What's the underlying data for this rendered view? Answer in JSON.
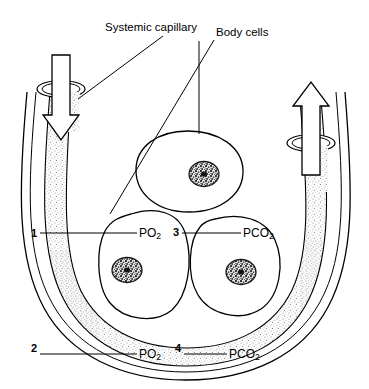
{
  "figure": {
    "title_labels": [
      {
        "id": "systemic-capillary",
        "text": "Systemic capillary",
        "x": 105,
        "y": 22
      },
      {
        "id": "body-cells",
        "text": "Body cells",
        "x": 216,
        "y": 27
      }
    ],
    "gas_labels": [
      {
        "id": "po2-upper",
        "text": "PO",
        "sub": "2",
        "x": 139,
        "y": 227
      },
      {
        "id": "pco2-upper",
        "text": "PCO",
        "sub": "2",
        "x": 243,
        "y": 227
      },
      {
        "id": "po2-lower",
        "text": "PO",
        "sub": "2",
        "x": 139,
        "y": 348
      },
      {
        "id": "pco2-lower",
        "text": "PCO",
        "sub": "2",
        "x": 229,
        "y": 348
      }
    ],
    "number_markers": [
      {
        "id": "marker-1",
        "text": "1",
        "x": 31,
        "y": 228
      },
      {
        "id": "marker-2",
        "text": "2",
        "x": 31,
        "y": 343
      },
      {
        "id": "marker-3",
        "text": "3",
        "x": 173,
        "y": 227
      },
      {
        "id": "marker-4",
        "text": "4",
        "x": 175,
        "y": 343
      }
    ],
    "structures": {
      "vessel_name": "systemic-capillary-vessel",
      "lumen_name": "capillary-lumen-stipple",
      "inflow_arrow": "blood-inflow-arrow-down",
      "outflow_arrow": "blood-outflow-arrow-up",
      "cells": [
        {
          "id": "body-cell-top",
          "nucleus": "nucleus-top"
        },
        {
          "id": "body-cell-left",
          "nucleus": "nucleus-left"
        },
        {
          "id": "body-cell-right",
          "nucleus": "nucleus-right"
        }
      ]
    },
    "colors": {
      "ink": "#000000",
      "stipple": "#8a8a8a",
      "background": "#ffffff"
    }
  }
}
